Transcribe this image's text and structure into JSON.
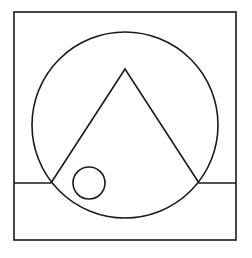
{
  "diagram": {
    "stroke_color": "#1a1a1a",
    "background": "#ffffff",
    "shapes": {
      "outer_square": {
        "x": 14,
        "y": 12,
        "width": 222,
        "height": 228
      },
      "large_circle": {
        "cx": 125,
        "cy": 125,
        "r": 93
      },
      "triangle": {
        "apex": [
          125,
          69
        ],
        "base_left": [
          51,
          183
        ],
        "base_right": [
          199,
          183
        ]
      },
      "left_line": {
        "x1": 14,
        "y1": 183,
        "x2": 51,
        "y2": 183
      },
      "right_line": {
        "x1": 199,
        "y1": 183,
        "x2": 236,
        "y2": 183
      },
      "small_circle": {
        "cx": 89,
        "cy": 183,
        "r": 16
      }
    }
  }
}
